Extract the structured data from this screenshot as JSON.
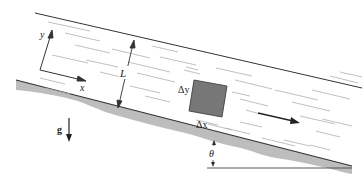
{
  "diagram": {
    "title": "",
    "labels": {
      "x_axis": "x",
      "y_axis": "y",
      "thickness": "L",
      "delta_y": "Δy",
      "delta_x": "Δx",
      "gravity": "g",
      "angle": "θ"
    },
    "colors": {
      "line": "#333333",
      "ground": "#b8b8b8",
      "element": "#777777",
      "streak": "#b0b0b0",
      "background": "#ffffff"
    },
    "elements": [
      {
        "id": "free-surface",
        "type": "line"
      },
      {
        "id": "inclined-wall",
        "type": "line"
      },
      {
        "id": "ground-hatch",
        "type": "shaded-region"
      },
      {
        "id": "fluid-element",
        "type": "square",
        "label_x": "Δx",
        "label_y": "Δy"
      },
      {
        "id": "coordinate-axes",
        "type": "axes",
        "labels": [
          "x",
          "y"
        ]
      },
      {
        "id": "thickness-dimension",
        "type": "double-arrow",
        "label": "L"
      },
      {
        "id": "gravity-arrow",
        "type": "arrow",
        "label": "g"
      },
      {
        "id": "flow-direction-arrow",
        "type": "arrow"
      },
      {
        "id": "incline-angle",
        "type": "angle",
        "label": "θ"
      },
      {
        "id": "horizontal-reference",
        "type": "line"
      }
    ]
  }
}
